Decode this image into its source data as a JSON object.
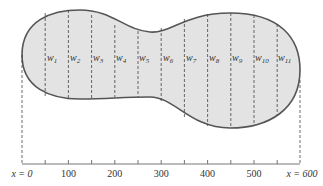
{
  "figure": {
    "fill_color": "#e3e3e3",
    "outline_color": "#555555",
    "widths": [
      {
        "label": "w",
        "sub": "1",
        "x": 50
      },
      {
        "label": "w",
        "sub": "2",
        "x": 100
      },
      {
        "label": "w",
        "sub": "3",
        "x": 150
      },
      {
        "label": "w",
        "sub": "4",
        "x": 200
      },
      {
        "label": "w",
        "sub": "5",
        "x": 250
      },
      {
        "label": "w",
        "sub": "6",
        "x": 300
      },
      {
        "label": "w",
        "sub": "7",
        "x": 350
      },
      {
        "label": "w",
        "sub": "8",
        "x": 400
      },
      {
        "label": "w",
        "sub": "9",
        "x": 450
      },
      {
        "label": "w",
        "sub": "10",
        "x": 500
      },
      {
        "label": "w",
        "sub": "11",
        "x": 550
      }
    ],
    "axis": {
      "start_label": "x = 0",
      "end_label": "x = 600",
      "tick_labels": [
        "100",
        "200",
        "300",
        "400",
        "500"
      ],
      "tick_spacing": 50,
      "range": [
        0,
        600
      ]
    }
  }
}
